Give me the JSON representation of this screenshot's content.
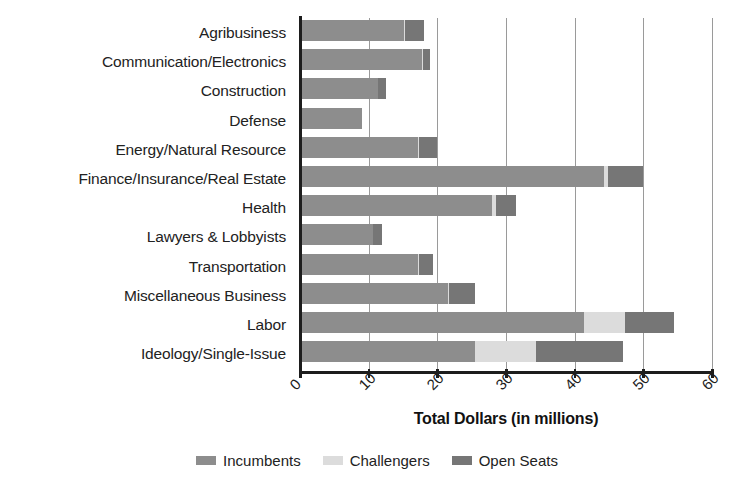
{
  "chart_data": {
    "type": "bar",
    "orientation": "horizontal",
    "stacked": true,
    "title": "",
    "xlabel": "Total Dollars (in millions)",
    "ylabel": "",
    "xlim": [
      0,
      60
    ],
    "xticks": [
      0,
      10,
      20,
      30,
      40,
      50,
      60
    ],
    "xtick_labels": [
      "0",
      "10",
      "20",
      "30",
      "40",
      "50",
      "60"
    ],
    "grid": "vertical",
    "legend_position": "bottom",
    "categories": [
      "Agribusiness",
      "Communication/Electronics",
      "Construction",
      "Defense",
      "Energy/Natural Resource",
      "Finance/Insurance/Real Estate",
      "Health",
      "Lawyers & Lobbyists",
      "Transportation",
      "Miscellaneous Business",
      "Labor",
      "Ideology/Single-Issue"
    ],
    "series": [
      {
        "name": "Incumbents",
        "color": "#8d8d8d",
        "values": [
          15.2,
          17.8,
          11.3,
          9.0,
          17.2,
          44.2,
          28.0,
          10.6,
          17.2,
          21.5,
          41.4,
          25.5
        ]
      },
      {
        "name": "Challengers",
        "color": "#dcdcdc",
        "values": [
          0.1,
          0.1,
          0.1,
          0.0,
          0.1,
          0.7,
          0.5,
          0.1,
          0.1,
          0.2,
          6.0,
          8.8
        ]
      },
      {
        "name": "Open Seats",
        "color": "#767676",
        "values": [
          2.7,
          1.1,
          1.1,
          0.0,
          2.7,
          5.1,
          3.0,
          1.3,
          2.0,
          3.8,
          7.1,
          12.7
        ]
      }
    ],
    "totals": [
      18.0,
      19.0,
      12.5,
      9.0,
      20.0,
      50.0,
      31.5,
      12.0,
      19.3,
      25.5,
      54.5,
      47.0
    ]
  },
  "legend": {
    "items": [
      {
        "label": "Incumbents",
        "color": "#8d8d8d",
        "swatch": "legend-swatch-incumbents"
      },
      {
        "label": "Challengers",
        "color": "#dcdcdc",
        "swatch": "legend-swatch-challengers"
      },
      {
        "label": "Open Seats",
        "color": "#767676",
        "swatch": "legend-swatch-open-seats"
      }
    ]
  },
  "axis": {
    "x_title": "Total Dollars (in millions)"
  }
}
